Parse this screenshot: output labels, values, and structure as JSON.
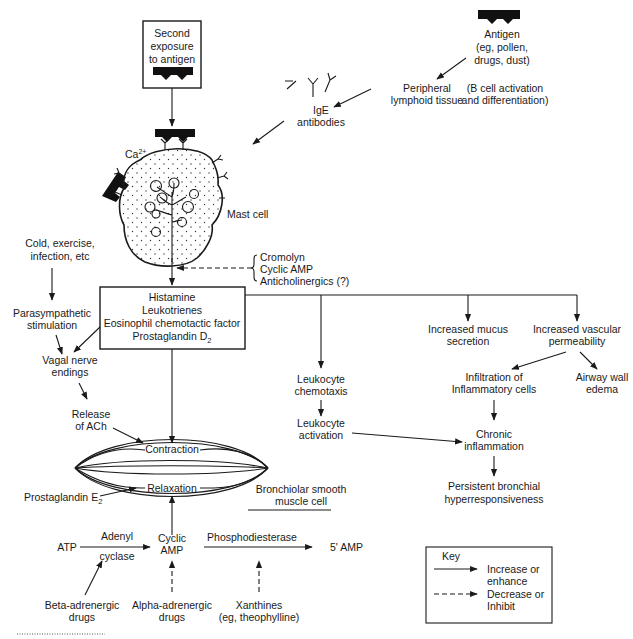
{
  "diagram": {
    "colors": {
      "ink": "#1a1a1a",
      "background": "#ffffff"
    },
    "second_exposure_box": [
      "Second",
      "exposure",
      "to antigen"
    ],
    "antigen": [
      "Antigen",
      "(eg, pollen,",
      "drugs, dust)"
    ],
    "peripheral": [
      "Peripheral",
      "lymphoid tissue"
    ],
    "b_cell_note": [
      "(B cell activation",
      "and differentiation)"
    ],
    "ige": [
      "IgE",
      "antibodies"
    ],
    "calcium": "Ca",
    "calcium_sup": "2+",
    "mast_cell": "Mast cell",
    "cold_exercise": [
      "Cold, exercise,",
      "infection, etc"
    ],
    "inhibitors": [
      "Cromolyn",
      "Cyclic AMP",
      "Anticholinergics (?)"
    ],
    "mediators_box": [
      "Histamine",
      "Leukotrienes",
      "Eosinophil chemotactic factor",
      "Prostaglandin D"
    ],
    "mediators_sub": "2",
    "parasympathetic": [
      "Parasympathetic",
      "stimulation"
    ],
    "vagal": [
      "Vagal nerve",
      "endings"
    ],
    "release_ach": [
      "Release",
      "of ACh"
    ],
    "contraction": "Contraction",
    "relaxation": "Relaxation",
    "prostaglandin_e": "Prostaglandin E",
    "prostaglandin_e_sub": "2",
    "smooth_muscle": [
      "Bronchiolar smooth",
      "muscle cell"
    ],
    "leukocyte_chemotaxis": [
      "Leukocyte",
      "chemotaxis"
    ],
    "leukocyte_activation": [
      "Leukocyte",
      "activation"
    ],
    "mucus": [
      "Increased mucus",
      "secretion"
    ],
    "vascular": [
      "Increased vascular",
      "permeability"
    ],
    "infiltration": [
      "Infiltration of",
      "Inflammatory cells"
    ],
    "edema": [
      "Airway wall",
      "edema"
    ],
    "chronic": [
      "Chronic",
      "inflammation"
    ],
    "persistent": [
      "Persistent bronchial",
      "hyperresponsiveness"
    ],
    "atp": "ATP",
    "adenyl": "Adenyl",
    "cyclase": "cyclase",
    "cyclic_amp": [
      "Cyclic",
      "AMP"
    ],
    "phosphodiesterase": "Phosphodiesterase",
    "five_amp": "5' AMP",
    "beta": [
      "Beta-adrenergic",
      "drugs"
    ],
    "alpha": [
      "Alpha-adrenergic",
      "drugs"
    ],
    "xanthines": [
      "Xanthines",
      "(eg, theophylline)"
    ],
    "key": {
      "title": "Key",
      "increase": [
        "Increase or",
        "enhance"
      ],
      "decrease": [
        "Decrease or",
        "Inhibit"
      ]
    }
  }
}
